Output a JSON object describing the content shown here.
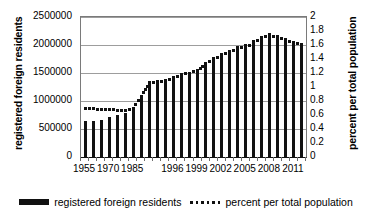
{
  "chart_data": {
    "type": "bar",
    "title": "",
    "xlabel": "",
    "ylabel": "registered foreign residents",
    "y2label": "percent per total population",
    "grid": true,
    "legend_position": "bottom",
    "ylim": [
      0,
      2500000
    ],
    "y2lim": [
      0,
      2
    ],
    "y_ticks": [
      "0",
      "500000",
      "1000000",
      "1500000",
      "2000000",
      "2500000"
    ],
    "y2_ticks": [
      "0",
      "0.2",
      "0.4",
      "0.6",
      "0.8",
      "1",
      "1.2",
      "1.4",
      "1.6",
      "1.8",
      "2"
    ],
    "x_tick_labels": [
      "1955",
      "1970",
      "1985",
      "1996",
      "1999",
      "2002",
      "2005",
      "2008",
      "2011"
    ],
    "categories": [
      "1955",
      "1960",
      "1965",
      "1970",
      "1975",
      "1980",
      "1985",
      "1990",
      "1993",
      "1994",
      "1995",
      "1996",
      "1997",
      "1998",
      "1999",
      "2000",
      "2001",
      "2002",
      "2003",
      "2004",
      "2005",
      "2006",
      "2007",
      "2008",
      "2009",
      "2010",
      "2011",
      "2012"
    ],
    "series": [
      {
        "name": "registered foreign residents",
        "axis": "left",
        "style": "bar",
        "color": "#111111",
        "values": [
          641482,
          650566,
          665989,
          708458,
          751842,
          782910,
          850612,
          1075317,
          1320748,
          1354011,
          1362371,
          1415136,
          1482707,
          1512116,
          1556113,
          1686444,
          1778462,
          1851758,
          1915030,
          1973747,
          2011555,
          2084919,
          2152973,
          2217426,
          2186121,
          2134151,
          2078508,
          2033656
        ]
      },
      {
        "name": "percent per total population",
        "axis": "right",
        "style": "dotted-line",
        "color": "#111111",
        "values": [
          0.7,
          0.69,
          0.68,
          0.68,
          0.67,
          0.67,
          0.7,
          0.87,
          1.06,
          1.08,
          1.09,
          1.13,
          1.18,
          1.2,
          1.23,
          1.33,
          1.4,
          1.45,
          1.5,
          1.55,
          1.57,
          1.63,
          1.69,
          1.74,
          1.71,
          1.67,
          1.63,
          1.6
        ]
      }
    ]
  },
  "legend": {
    "items": [
      {
        "label": "registered foreign residents",
        "marker": "bar-swatch"
      },
      {
        "label": "percent per total population",
        "marker": "dots-swatch"
      }
    ]
  }
}
